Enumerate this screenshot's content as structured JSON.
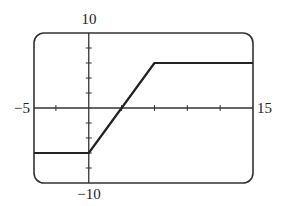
{
  "chart_data": {
    "type": "line",
    "title": "",
    "xlabel": "",
    "ylabel": "",
    "xlim": [
      -5,
      15
    ],
    "ylim": [
      -10,
      10
    ],
    "x_tick_step": 3,
    "y_tick_step": 2,
    "grid": false,
    "axis_labels": {
      "xmin": "−5",
      "xmax": "15",
      "ymax": "10",
      "ymin": "−10"
    },
    "series": [
      {
        "name": "f(x)",
        "color": "#222222",
        "x": [
          -5,
          0,
          6,
          15
        ],
        "y": [
          -6,
          -6,
          6,
          6
        ]
      }
    ],
    "frame": {
      "rounded": true,
      "color": "#333333"
    }
  }
}
